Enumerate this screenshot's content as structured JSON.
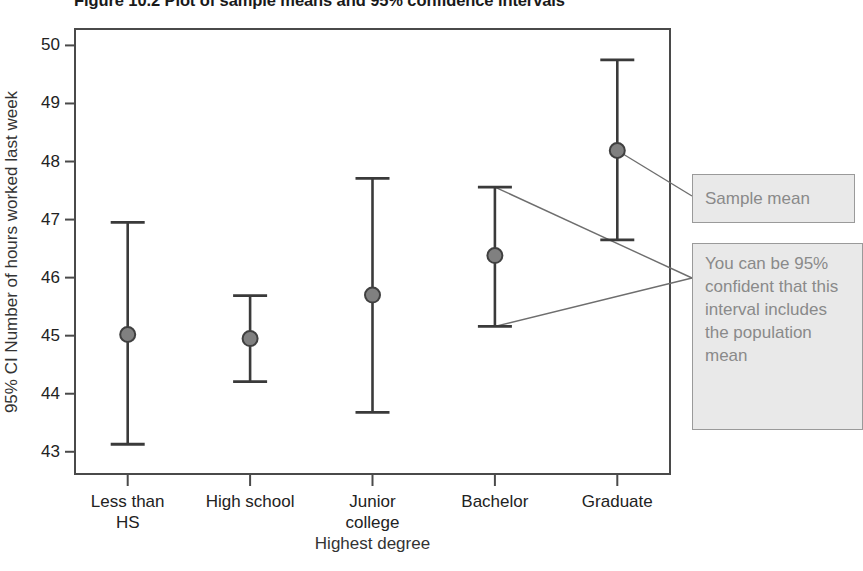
{
  "figure": {
    "title": "Figure 10.2 Plot of sample means and 95% confidence intervals",
    "xlabel": "Highest degree",
    "ylabel": "95% CI Number of hours worked last week"
  },
  "callouts": {
    "sample_mean": "Sample mean",
    "ci_explain": "You can be 95% confident that this interval includes the population mean"
  },
  "colors": {
    "marker_fill": "#808080",
    "marker_stroke": "#404040",
    "error_bar": "#3a3a3a",
    "frame": "#4a4a4a",
    "callout_bg": "#e9e9e9",
    "callout_border": "#9a9a9a",
    "callout_text": "#8a8a8a",
    "leader_line": "#6e6e6e"
  },
  "chart_data": {
    "type": "scatter",
    "title": "Figure 10.2 Plot of sample means and 95% confidence intervals",
    "xlabel": "Highest degree",
    "ylabel": "95% CI Number of hours worked last week",
    "grid": false,
    "legend": "none",
    "ylim": [
      42.6,
      50.3
    ],
    "yticks": [
      43,
      44,
      45,
      46,
      47,
      48,
      49,
      50
    ],
    "ytick_labels": [
      "43",
      "44",
      "45",
      "46",
      "47",
      "48",
      "49",
      "50"
    ],
    "categories": [
      "Less than HS",
      "High school",
      "Junior college",
      "Bachelor",
      "Graduate"
    ],
    "category_lines": [
      [
        "Less than",
        "HS"
      ],
      [
        "High school"
      ],
      [
        "Junior",
        "college"
      ],
      [
        "Bachelor"
      ],
      [
        "Graduate"
      ]
    ],
    "series": [
      {
        "name": "95% CI Number of hours worked last week",
        "marker": "circle",
        "values": [
          45.02,
          44.95,
          45.7,
          46.38,
          48.19
        ],
        "ci_lower": [
          43.13,
          44.21,
          43.68,
          45.16,
          46.65
        ],
        "ci_upper": [
          46.95,
          45.69,
          47.71,
          47.56,
          49.75
        ]
      }
    ],
    "annotations": [
      {
        "text": "Sample mean",
        "points_to": "Graduate sample mean marker"
      },
      {
        "text": "You can be 95% confident that this interval includes the population mean",
        "points_to": "Bachelor confidence interval upper and lower bounds"
      }
    ]
  }
}
